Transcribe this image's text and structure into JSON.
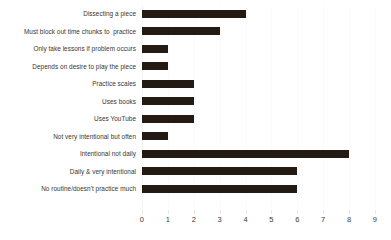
{
  "chart_data": {
    "type": "bar",
    "orientation": "horizontal",
    "title": "",
    "subtitle": "",
    "xlabel": "",
    "ylabel": "",
    "xlim": [
      0,
      9
    ],
    "ylim": null,
    "grid": true,
    "legend": null,
    "legend_position": "none",
    "xticks": [
      "0",
      "1",
      "2",
      "3",
      "4",
      "5",
      "6",
      "7",
      "8",
      "9"
    ],
    "categories": [
      "Dissecting a piece",
      "Must block out time chunks to  practice",
      "Only take lessons if problem occurs",
      "Depends on desire to play the piece",
      "Practice scales",
      "Uses books",
      "Uses YouTube",
      "Not very intentional but often",
      "Intentional not daily",
      "Daily & very intentional",
      "No routine/doesn't practice much"
    ],
    "values": [
      4,
      3,
      1,
      1,
      2,
      2,
      2,
      1,
      8,
      6,
      6
    ],
    "bar_color": "#241a14",
    "grid_color": "#fbfbfc",
    "text_color": "#38352f",
    "background_color": "#ffffff"
  }
}
